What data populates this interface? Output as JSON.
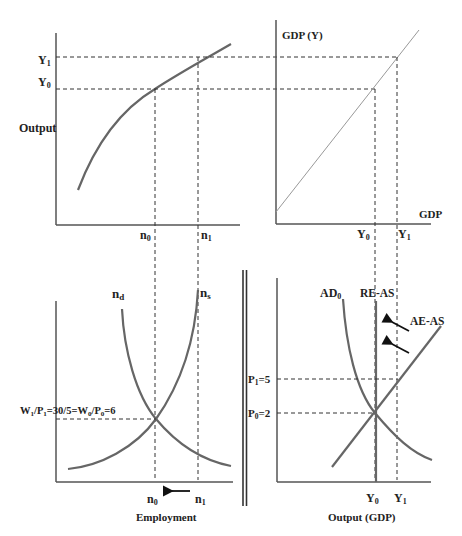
{
  "panels": {
    "production": {
      "y_label": "Output",
      "y_ticks": [
        "Y1",
        "Y0"
      ],
      "x_ticks": [
        "n0",
        "n1"
      ]
    },
    "identity": {
      "y_label": "GDP (Y)",
      "x_label": "GDP",
      "x_ticks": [
        "Y0",
        "Y1"
      ]
    },
    "labor_market": {
      "demand_label": "n",
      "demand_sub": "d",
      "supply_label": "n",
      "supply_sub": "s",
      "wage_label": "W1/P1=30/5=W0/P0=6",
      "x_ticks": [
        "n0",
        "n1"
      ],
      "x_label": "Employment"
    },
    "ad_as": {
      "ad_label": "AD0",
      "re_as_label": "RE-AS",
      "ae_as_label": "AE-AS",
      "p_ticks": [
        "P1=5",
        "P0=2"
      ],
      "x_ticks": [
        "Y0",
        "Y1"
      ],
      "x_label": "Output (GDP)"
    }
  }
}
